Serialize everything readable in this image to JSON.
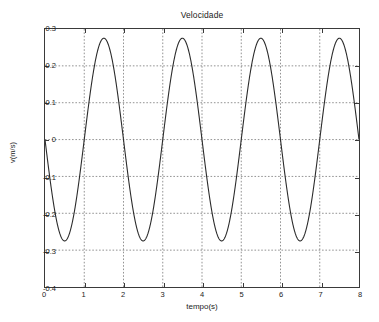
{
  "chart_data": {
    "type": "line",
    "title": "Velocidade",
    "xlabel": "tempo(s)",
    "ylabel": "v(m/s)",
    "xlim": [
      0,
      8
    ],
    "ylim": [
      -0.4,
      0.3
    ],
    "grid": true,
    "legend": null,
    "xticks": [
      0,
      1,
      2,
      3,
      4,
      5,
      6,
      7,
      8
    ],
    "xtick_labels": [
      "0",
      "1",
      "2",
      "3",
      "4",
      "5",
      "6",
      "7",
      "8"
    ],
    "yticks": [
      0.3,
      0.2,
      0.1,
      0,
      -0.1,
      -0.2,
      -0.3,
      -0.4
    ],
    "ytick_labels": [
      "0.3",
      "0.2",
      "0.1",
      "0",
      "-0.1",
      "-0.2",
      "-0.3",
      "-0.4"
    ],
    "line_color": "#2b2b2b",
    "grid_color": "#777777",
    "axis_color": "#3a3a3a",
    "series": [
      {
        "name": "v",
        "amplitude": 0.275,
        "period": 2.0,
        "phase_deg": 180,
        "offset": 0.0,
        "description": "v(t) = -0.275 * sin(2*pi*t/2)",
        "x": [
          0.0,
          0.1,
          0.2,
          0.3,
          0.4,
          0.5,
          0.6,
          0.7,
          0.8,
          0.9,
          1.0,
          1.1,
          1.2,
          1.3,
          1.4,
          1.5,
          1.6,
          1.7,
          1.8,
          1.9,
          2.0,
          2.1,
          2.2,
          2.3,
          2.4,
          2.5,
          2.6,
          2.7,
          2.8,
          2.9,
          3.0,
          3.1,
          3.2,
          3.3,
          3.4,
          3.5,
          3.6,
          3.7,
          3.8,
          3.9,
          4.0,
          4.1,
          4.2,
          4.3,
          4.4,
          4.5,
          4.6,
          4.7,
          4.8,
          4.9,
          5.0,
          5.1,
          5.2,
          5.3,
          5.4,
          5.5,
          5.6,
          5.7,
          5.8,
          5.9,
          6.0,
          6.1,
          6.2,
          6.3,
          6.4,
          6.5,
          6.6,
          6.7,
          6.8,
          6.9,
          7.0,
          7.1,
          7.2,
          7.3,
          7.4,
          7.5,
          7.6,
          7.7,
          7.8,
          7.9,
          8.0
        ],
        "y": [
          0.0,
          -0.085,
          -0.162,
          -0.222,
          -0.261,
          -0.275,
          -0.261,
          -0.222,
          -0.162,
          -0.085,
          0.0,
          0.085,
          0.162,
          0.222,
          0.261,
          0.275,
          0.261,
          0.222,
          0.162,
          0.085,
          0.0,
          -0.085,
          -0.162,
          -0.222,
          -0.261,
          -0.275,
          -0.261,
          -0.222,
          -0.162,
          -0.085,
          0.0,
          0.085,
          0.162,
          0.222,
          0.261,
          0.275,
          0.261,
          0.222,
          0.162,
          0.085,
          0.0,
          -0.085,
          -0.162,
          -0.222,
          -0.261,
          -0.275,
          -0.261,
          -0.222,
          -0.162,
          -0.085,
          0.0,
          0.085,
          0.162,
          0.222,
          0.261,
          0.275,
          0.261,
          0.222,
          0.162,
          0.085,
          0.0,
          -0.085,
          -0.162,
          -0.222,
          -0.261,
          -0.275,
          -0.261,
          -0.222,
          -0.162,
          -0.085,
          0.0,
          0.085,
          0.162,
          0.222,
          0.261,
          0.275,
          0.261,
          0.222,
          0.162,
          0.085,
          0.0
        ]
      }
    ],
    "peaks": [
      {
        "t": 1.5,
        "v": 0.275
      },
      {
        "t": 3.5,
        "v": 0.275
      },
      {
        "t": 5.5,
        "v": 0.275
      },
      {
        "t": 7.5,
        "v": 0.275
      }
    ],
    "troughs": [
      {
        "t": 0.5,
        "v": -0.275
      },
      {
        "t": 2.5,
        "v": -0.275
      },
      {
        "t": 4.5,
        "v": -0.275
      },
      {
        "t": 6.5,
        "v": -0.275
      }
    ]
  }
}
